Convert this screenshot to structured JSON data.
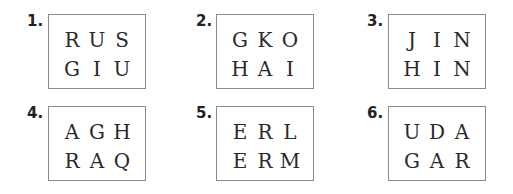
{
  "puzzles": [
    {
      "number": "1.",
      "rows": [
        [
          "R",
          "U",
          "S"
        ],
        [
          "G",
          "I",
          "U"
        ]
      ]
    },
    {
      "number": "2.",
      "rows": [
        [
          "G",
          "K",
          "O"
        ],
        [
          "H",
          "A",
          "I"
        ]
      ]
    },
    {
      "number": "3.",
      "rows": [
        [
          "J",
          "I",
          "N"
        ],
        [
          "H",
          "I",
          "N"
        ]
      ]
    },
    {
      "number": "4.",
      "rows": [
        [
          "A",
          "G",
          "H"
        ],
        [
          "R",
          "A",
          "Q"
        ]
      ]
    },
    {
      "number": "5.",
      "rows": [
        [
          "E",
          "R",
          "L"
        ],
        [
          "E",
          "R",
          "M"
        ]
      ]
    },
    {
      "number": "6.",
      "rows": [
        [
          "U",
          "D",
          "A"
        ],
        [
          "G",
          "A",
          "R"
        ]
      ]
    }
  ]
}
